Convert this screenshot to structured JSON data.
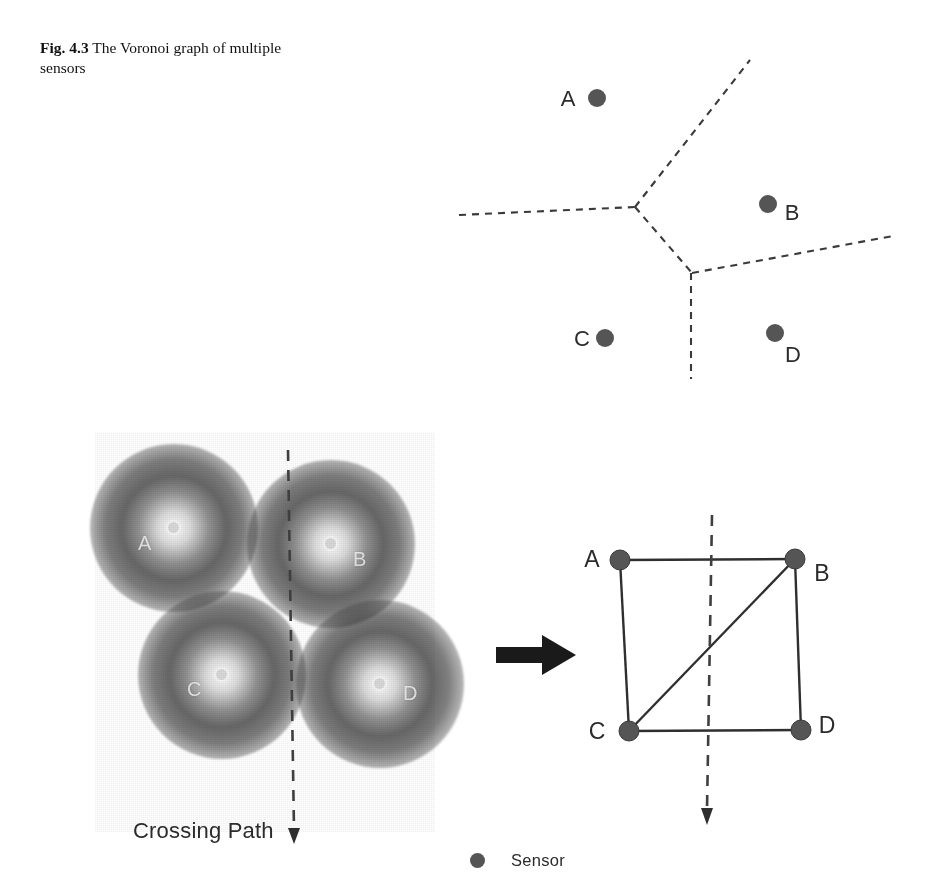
{
  "figure": {
    "number": "Fig. 4.3",
    "caption": "The Voronoi graph of multiple sensors"
  },
  "colors": {
    "sensor_dot": "#555555",
    "edge": "#333333",
    "dashed": "#3a3a3a",
    "arrow": "#1a1a1a",
    "text": "#2b2b2b"
  },
  "voronoi_panel": {
    "name": "voronoi-diagram",
    "sensors": [
      {
        "id": "A",
        "label": "A",
        "label_x": 128,
        "label_y": 52,
        "dot_x": 167,
        "dot_y": 48,
        "r": 9
      },
      {
        "id": "B",
        "label": "B",
        "label_x": 355,
        "label_y": 166,
        "dot_x": 338,
        "dot_y": 154,
        "r": 9
      },
      {
        "id": "C",
        "label": "C",
        "label_x": 144,
        "label_y": 291,
        "dot_x": 175,
        "dot_y": 288,
        "r": 9
      },
      {
        "id": "D",
        "label": "D",
        "label_x": 356,
        "label_y": 308,
        "dot_x": 345,
        "dot_y": 283,
        "r": 9
      }
    ],
    "vertices": [
      {
        "id": "v1",
        "x": 205,
        "y": 157
      },
      {
        "id": "v2",
        "x": 262,
        "y": 223
      }
    ],
    "edges": [
      {
        "id": "edge-left",
        "x1": 29,
        "y1": 165,
        "x2": 205,
        "y2": 157
      },
      {
        "id": "edge-upper-right",
        "x1": 205,
        "y1": 157,
        "x2": 320,
        "y2": 10
      },
      {
        "id": "edge-middle",
        "x1": 205,
        "y1": 157,
        "x2": 262,
        "y2": 223
      },
      {
        "id": "edge-right",
        "x1": 262,
        "y1": 223,
        "x2": 463,
        "y2": 186
      },
      {
        "id": "edge-bottom",
        "x1": 261,
        "y1": 223,
        "x2": 261,
        "y2": 329
      }
    ]
  },
  "sensor_field_panel": {
    "name": "sensor-coverage-field",
    "sensors": [
      {
        "id": "A",
        "label": "A",
        "cx": 79,
        "cy": 96,
        "radius": 84,
        "label_x": 43,
        "label_y": 112
      },
      {
        "id": "B",
        "label": "B",
        "cx": 236,
        "cy": 112,
        "radius": 84,
        "label_x": 258,
        "label_y": 128
      },
      {
        "id": "C",
        "label": "C",
        "cx": 127,
        "cy": 243,
        "radius": 84,
        "label_x": 92,
        "label_y": 258
      },
      {
        "id": "D",
        "label": "D",
        "cx": 285,
        "cy": 252,
        "radius": 84,
        "label_x": 308,
        "label_y": 262
      }
    ],
    "crossing_path": {
      "label": "Crossing Path",
      "x1": 193,
      "y1": 18,
      "x2": 199,
      "y2": 400
    }
  },
  "transform_arrow": {
    "name": "transform-arrow",
    "x": 497,
    "y": 637,
    "width": 78,
    "height": 40
  },
  "graph_panel": {
    "name": "sensor-graph",
    "nodes": [
      {
        "id": "A",
        "label": "A",
        "x": 620,
        "y": 560,
        "label_x": 592,
        "label_y": 566
      },
      {
        "id": "B",
        "label": "B",
        "x": 795,
        "y": 559,
        "label_x": 818,
        "label_y": 572
      },
      {
        "id": "C",
        "label": "C",
        "x": 629,
        "y": 731,
        "label_x": 597,
        "label_y": 737
      },
      {
        "id": "D",
        "label": "D",
        "x": 801,
        "y": 730,
        "label_x": 823,
        "label_y": 730
      }
    ],
    "edges": [
      {
        "from": "A",
        "to": "B"
      },
      {
        "from": "A",
        "to": "C"
      },
      {
        "from": "B",
        "to": "D"
      },
      {
        "from": "C",
        "to": "D"
      },
      {
        "from": "C",
        "to": "B"
      }
    ],
    "crossing_path": {
      "x1": 712,
      "y1": 515,
      "x2": 707,
      "y2": 825
    }
  },
  "legend": {
    "name": "legend",
    "marker": "sensor-dot-icon",
    "label": "Sensor"
  }
}
